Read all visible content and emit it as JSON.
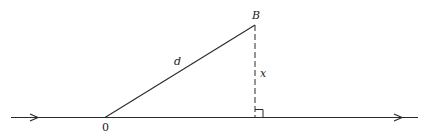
{
  "diagram": {
    "type": "geometry",
    "labels": {
      "point_b": "B",
      "origin": "0",
      "hypotenuse": "d",
      "height": "x"
    },
    "colors": {
      "stroke": "#2a2a2a",
      "background": "#ffffff"
    }
  }
}
